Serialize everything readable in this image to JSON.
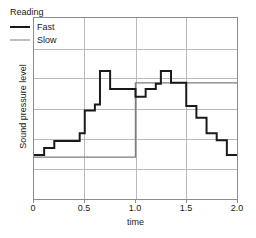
{
  "chart_data": {
    "type": "line",
    "subtype": "step-post",
    "title": "",
    "xlabel": "time",
    "ylabel": "Sound pressure level",
    "xlim": [
      0,
      2.0
    ],
    "ylim": [
      0,
      6
    ],
    "xticks": [
      0,
      0.5,
      1.0,
      1.5,
      2.0
    ],
    "xticklabels": [
      "0",
      "0.5",
      "1.0",
      "1.5",
      "2.0"
    ],
    "yticks": [],
    "yticklabels": [],
    "grid": true,
    "grid_axis": "both",
    "y_gridlines": [
      1,
      2,
      3,
      4,
      5
    ],
    "x_gridlines": [
      0.5,
      1.0,
      1.5
    ],
    "legend": {
      "title": "Reading",
      "position": "upper left",
      "entries": [
        {
          "name": "Fast",
          "color": "#1a1a1a",
          "width": 2.0
        },
        {
          "name": "Slow",
          "color": "#7d7d7d",
          "width": 1.4
        }
      ]
    },
    "series": [
      {
        "name": "Fast",
        "color": "#1a1a1a",
        "x": [
          0.0,
          0.1,
          0.2,
          0.45,
          0.5,
          0.6,
          0.65,
          0.75,
          1.0,
          1.1,
          1.2,
          1.25,
          1.35,
          1.5,
          1.6,
          1.7,
          1.8,
          1.9,
          2.0
        ],
        "y": [
          1.46,
          1.69,
          1.92,
          2.18,
          2.93,
          3.13,
          4.24,
          3.65,
          3.39,
          3.65,
          3.82,
          4.24,
          3.85,
          3.08,
          2.69,
          2.18,
          1.95,
          1.46,
          1.46
        ]
      },
      {
        "name": "Slow",
        "color": "#7d7d7d",
        "x": [
          0.0,
          1.0,
          2.0
        ],
        "y": [
          1.39,
          3.85,
          3.85
        ]
      }
    ]
  },
  "axes": {
    "x_label": "time",
    "y_label": "Sound pressure level",
    "x_tick_labels": [
      "0",
      "0.5",
      "1.0",
      "1.5",
      "2.0"
    ]
  },
  "legend": {
    "title": "Reading",
    "fast_label": "Fast",
    "slow_label": "Slow"
  },
  "colors": {
    "fast": "#1a1a1a",
    "slow": "#7d7d7d",
    "grid": "#b8b8b8",
    "frame": "#8c8c8c",
    "background": "#ffffff"
  }
}
